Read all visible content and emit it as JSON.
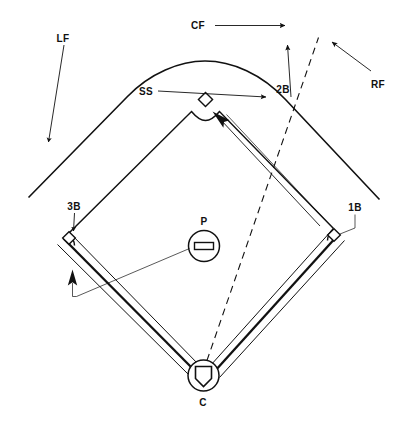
{
  "diagram": {
    "background_color": "#ffffff",
    "line_color": "#111111",
    "labels": {
      "left_field": "LF",
      "center_field": "CF",
      "right_field": "RF",
      "shortstop": "SS",
      "second_base": "2B",
      "third_base": "3B",
      "first_base": "1B",
      "pitcher": "P",
      "catcher": "C"
    },
    "elements": {
      "outfield_fence": "outfield-fence",
      "infield_grass": "infield-grass-boundary",
      "foul_line_third": "third-base-foul-line",
      "foul_line_first": "first-base-foul-line",
      "base_second": "second-base-marker",
      "base_third": "third-base-marker",
      "base_first": "first-base-marker",
      "pitcher_mound": "pitcher-mound-circle",
      "pitcher_rubber": "pitcher-rubber",
      "home_plate": "home-plate-marker",
      "catcher_circle": "catcher-circle",
      "runner_path": "dashed-runner-path"
    },
    "arrows": {
      "cf_arrow": "center-field-arrow",
      "lf_arrow": "left-field-arrow",
      "rf_arrow": "right-field-arrow",
      "ss_arrow": "shortstop-arrow",
      "second_base_up_arrow": "second-base-up-arrow",
      "third_base_arrow": "third-base-arrow",
      "baseline_arrow": "baseline-direction-arrow",
      "foul_line_arrow": "foul-line-callout-arrow",
      "first_base_leader": "first-base-leader-line"
    }
  }
}
